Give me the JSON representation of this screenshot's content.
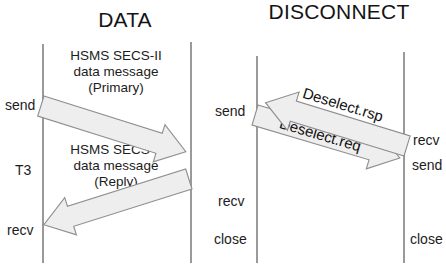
{
  "diagrams": [
    {
      "id": "data",
      "title": "DATA",
      "left_lifeline_labels": [
        "send",
        "T3",
        "recv"
      ],
      "right_lifeline_labels": [],
      "messages": [
        {
          "name": "primary-data-message",
          "label_lines": [
            "HSMS SECS-II",
            "data message",
            "(Primary)"
          ],
          "direction": "left-to-right",
          "from_label": "send",
          "arrow_text": ""
        },
        {
          "name": "reply-data-message",
          "label_lines": [
            "HSMS SECS-II",
            "data message",
            "(Reply)"
          ],
          "direction": "right-to-left",
          "to_label": "recv",
          "arrow_text": ""
        }
      ],
      "timer": "T3"
    },
    {
      "id": "disconnect",
      "title": "DISCONNECT",
      "left_lifeline_labels": [
        "send",
        "recv",
        "close"
      ],
      "right_lifeline_labels": [
        "recv",
        "send",
        "close"
      ],
      "messages": [
        {
          "name": "deselect-req-message",
          "arrow_text": "Deselect.req",
          "direction": "left-to-right"
        },
        {
          "name": "deselect-rsp-message",
          "arrow_text": "Deselect.rsp",
          "direction": "right-to-left"
        }
      ]
    }
  ],
  "data_diagram": {
    "title": "DATA",
    "label_send": "send",
    "label_t3": "T3",
    "label_recv": "recv",
    "primary_line1": "HSMS SECS-II",
    "primary_line2": "data message",
    "primary_line3": "(Primary)",
    "reply_line1": "HSMS SECS-II",
    "reply_line2": "data message",
    "reply_line3": "(Reply)"
  },
  "disconnect_diagram": {
    "title": "DISCONNECT",
    "left_send": "send",
    "left_recv": "recv",
    "left_close": "close",
    "right_recv": "recv",
    "right_send": "send",
    "right_close": "close",
    "arrow_req_text": "Deselect.req",
    "arrow_rsp_text": "Deselect.rsp"
  },
  "colors": {
    "background": "#ffffff",
    "text": "#1c1c1c",
    "lifeline": "#9a9a9a",
    "arrow_fill": "#eeeeee",
    "arrow_stroke": "#8d8d8d"
  }
}
